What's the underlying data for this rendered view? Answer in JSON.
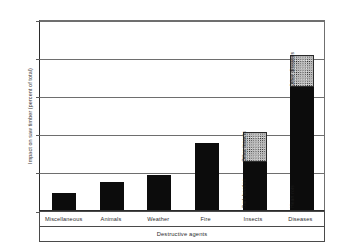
{
  "chart_data": {
    "type": "bar",
    "title": "",
    "subtitle": "",
    "xlabel": "Destructive agents",
    "ylabel": "Impact on saw timber (percent of total)",
    "categories": [
      "Miscellaneous",
      "Animals",
      "Weather",
      "Fire",
      "Insects",
      "Diseases"
    ],
    "values": [
      4.5,
      7.3,
      9.2,
      17.5,
      20.3,
      40.7
    ],
    "series": [
      {
        "name": "Primary",
        "values": [
          4.5,
          7.3,
          9.2,
          17.5,
          12.6,
          32.3
        ],
        "fill": "solid-black"
      },
      {
        "name": "Secondary",
        "values": [
          0,
          0,
          0,
          0,
          7.7,
          8.4
        ],
        "fill": "stippled-gray"
      }
    ],
    "segment_labels": {
      "insects_lower": "Bark beetles",
      "insects_upper": "Other insects",
      "diseases_lower": "Heart rots",
      "diseases_upper": "Other diseases"
    },
    "yticks": [
      0,
      10,
      20,
      30,
      40,
      50
    ],
    "ytick_labels": [
      "0",
      "10",
      "20",
      "30",
      "40",
      "50"
    ],
    "ylim": [
      0,
      50
    ],
    "grid": true,
    "grid_axis": "y",
    "legend": "none",
    "legend_position": "none",
    "colors": {
      "bar_primary": "#0c0c0c",
      "bar_secondary": "#b9b9b9",
      "axis": "#2b2b2b",
      "grid": "#6e6e6e",
      "text": "#2c2c2c",
      "background": "#ffffff"
    }
  },
  "axis": {
    "y_title": "Impact on saw timber (percent of total)",
    "x_title": "Destructive agents",
    "ticks": [
      {
        "value": 50,
        "label": "50"
      },
      {
        "value": 40,
        "label": "40"
      },
      {
        "value": 30,
        "label": "30"
      },
      {
        "value": 20,
        "label": "20"
      },
      {
        "value": 10,
        "label": "10"
      },
      {
        "value": 0,
        "label": "0"
      }
    ]
  },
  "bars": [
    {
      "category": "Miscellaneous",
      "total": 4.5,
      "lower": 4.5,
      "upper": 0,
      "lower_label": "",
      "upper_label": ""
    },
    {
      "category": "Animals",
      "total": 7.3,
      "lower": 7.3,
      "upper": 0,
      "lower_label": "",
      "upper_label": ""
    },
    {
      "category": "Weather",
      "total": 9.2,
      "lower": 9.2,
      "upper": 0,
      "lower_label": "",
      "upper_label": ""
    },
    {
      "category": "Fire",
      "total": 17.5,
      "lower": 17.5,
      "upper": 0,
      "lower_label": "",
      "upper_label": ""
    },
    {
      "category": "Insects",
      "total": 20.3,
      "lower": 12.6,
      "upper": 7.7,
      "lower_label": "Bark beetles",
      "upper_label": "Other insects"
    },
    {
      "category": "Diseases",
      "total": 40.7,
      "lower": 32.3,
      "upper": 8.4,
      "lower_label": "Heart rots",
      "upper_label": "Other diseases"
    }
  ]
}
